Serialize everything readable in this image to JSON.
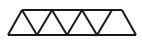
{
  "figure": {
    "background_color": "#ffffff",
    "canvas": {
      "width": 142,
      "height": 43
    }
  },
  "chart_data": {
    "type": "diagram",
    "subtype": "warren-truss",
    "triangle_count": 7,
    "upward_triangle_count": 4,
    "downward_triangle_count": 3,
    "coordinate_system": "pixels, origin top-left",
    "geometry": {
      "top_chord_y": 10,
      "bottom_chord_y": 35,
      "top_chord_x_start": 22,
      "top_chord_x_end": 122,
      "bottom_chord_x_start": 8,
      "bottom_chord_x_end": 136,
      "top_nodes_x": [
        22,
        52,
        82,
        112
      ],
      "bottom_nodes_x": [
        8,
        37,
        67,
        97,
        136
      ],
      "panel_pitch": 30
    },
    "nodes": [
      {
        "id": "B0",
        "label": "bottom-left-corner",
        "x": 8,
        "y": 35
      },
      {
        "id": "T0",
        "label": "top-node-1",
        "x": 22,
        "y": 10
      },
      {
        "id": "B1",
        "label": "bottom-node-1",
        "x": 37,
        "y": 35
      },
      {
        "id": "T1",
        "label": "top-node-2",
        "x": 52,
        "y": 10
      },
      {
        "id": "B2",
        "label": "bottom-node-2",
        "x": 67,
        "y": 35
      },
      {
        "id": "T2",
        "label": "top-node-3",
        "x": 82,
        "y": 10
      },
      {
        "id": "B3",
        "label": "bottom-node-3",
        "x": 97,
        "y": 35
      },
      {
        "id": "T3",
        "label": "top-node-4",
        "x": 112,
        "y": 10
      },
      {
        "id": "B4",
        "label": "bottom-right-corner",
        "x": 136,
        "y": 35
      }
    ],
    "members": [
      {
        "id": "M1",
        "name": "top-chord",
        "from": "T0",
        "to": "T3",
        "x1": 22,
        "y1": 10,
        "x2": 122,
        "y2": 10,
        "stroke": "#1a1a1a",
        "width": 2.0
      },
      {
        "id": "M2",
        "name": "bottom-chord",
        "from": "B0",
        "to": "B4",
        "x1": 8,
        "y1": 35,
        "x2": 136,
        "y2": 35,
        "stroke": "#1a1a1a",
        "width": 2.2
      },
      {
        "id": "M3",
        "name": "diagonal-1",
        "from": "B0",
        "to": "T0",
        "x1": 8,
        "y1": 35,
        "x2": 22,
        "y2": 10,
        "stroke": "#1a1a1a",
        "width": 2.0
      },
      {
        "id": "M4",
        "name": "diagonal-2",
        "from": "T0",
        "to": "B1",
        "x1": 22,
        "y1": 10,
        "x2": 37,
        "y2": 35,
        "stroke": "#1a1a1a",
        "width": 2.0
      },
      {
        "id": "M5",
        "name": "diagonal-3",
        "from": "B1",
        "to": "T1",
        "x1": 37,
        "y1": 35,
        "x2": 52,
        "y2": 10,
        "stroke": "#1a1a1a",
        "width": 2.0
      },
      {
        "id": "M6",
        "name": "diagonal-4",
        "from": "T1",
        "to": "B2",
        "x1": 52,
        "y1": 10,
        "x2": 67,
        "y2": 35,
        "stroke": "#1a1a1a",
        "width": 2.0
      },
      {
        "id": "M7",
        "name": "diagonal-5",
        "from": "B2",
        "to": "T2",
        "x1": 67,
        "y1": 35,
        "x2": 82,
        "y2": 10,
        "stroke": "#1a1a1a",
        "width": 2.0
      },
      {
        "id": "M8",
        "name": "diagonal-6",
        "from": "T2",
        "to": "B3",
        "x1": 82,
        "y1": 10,
        "x2": 97,
        "y2": 35,
        "stroke": "#1a1a1a",
        "width": 2.0
      },
      {
        "id": "M9",
        "name": "diagonal-7",
        "from": "B3",
        "to": "T3",
        "x1": 97,
        "y1": 35,
        "x2": 112,
        "y2": 10,
        "stroke": "#1a1a1a",
        "width": 2.0
      },
      {
        "id": "M10",
        "name": "diagonal-8",
        "from": "T3",
        "to": "B4",
        "x1": 122,
        "y1": 10,
        "x2": 136,
        "y2": 35,
        "stroke": "#1a1a1a",
        "width": 2.0
      }
    ],
    "stroke_color": "#1a1a1a",
    "background": "#ffffff",
    "legend": null,
    "annotations": []
  }
}
